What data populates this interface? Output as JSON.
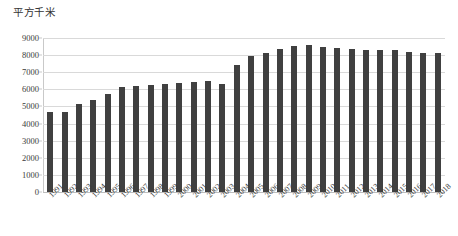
{
  "chart_data": {
    "type": "bar",
    "title": "平方千米",
    "xlabel": "",
    "ylabel": "",
    "ylim": [
      0,
      9000
    ],
    "ytick_step": 1000,
    "grid": true,
    "legend": "none",
    "bar_color": "#404040",
    "gridline_color": "#d9d9d9",
    "categories": [
      "1991",
      "1992",
      "1993",
      "1994",
      "1995",
      "1996",
      "1997",
      "1998",
      "1999",
      "2000",
      "2001",
      "2002",
      "2003",
      "2004",
      "2005",
      "2006",
      "2007",
      "2008",
      "2009",
      "2010",
      "2011",
      "2012",
      "2013",
      "2014",
      "2015",
      "2016",
      "2017",
      "2018"
    ],
    "values": [
      4650,
      4650,
      5150,
      5350,
      5700,
      6150,
      6200,
      6250,
      6300,
      6350,
      6450,
      6500,
      6300,
      7400,
      7950,
      8150,
      8350,
      8550,
      8600,
      8500,
      8400,
      8350,
      8300,
      8300,
      8300,
      8200,
      8100,
      8150
    ],
    "ytick_labels": [
      "9000",
      "8000",
      "7000",
      "6000",
      "5000",
      "4000",
      "3000",
      "2000",
      "1000",
      "0"
    ],
    "ytick_values": [
      9000,
      8000,
      7000,
      6000,
      5000,
      4000,
      3000,
      2000,
      1000,
      0
    ]
  }
}
